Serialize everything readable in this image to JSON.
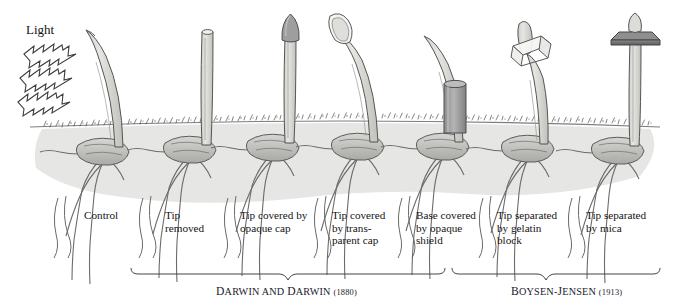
{
  "figure": {
    "title_word": "Light",
    "soil_color": "#e3e3e3",
    "coleoptile_color": "#d8d8d4",
    "opaque_color": "#9a9a9a",
    "mica_color": "#6e6e6e",
    "outline_color": "#4a4a4a",
    "background": "#ffffff"
  },
  "light": {
    "label": "Light",
    "arrow_count": 3,
    "direction": "left-to-right-downward",
    "icon": "lightning-arrow-icon"
  },
  "specimens": [
    {
      "index": 1,
      "label": "Control",
      "treatment": "none",
      "tip_state": "intact",
      "response": "bends toward light",
      "stem_x": 120
    },
    {
      "index": 2,
      "label": "Tip\nremoved",
      "treatment": "tip cut off",
      "tip_state": "removed",
      "response": "no bending",
      "stem_x": 207
    },
    {
      "index": 3,
      "label": "Tip covered by\nopaque cap",
      "treatment": "opaque cap over tip",
      "tip_state": "covered-opaque",
      "response": "no bending",
      "stem_x": 290
    },
    {
      "index": 4,
      "label": "Tip covered\nby trans-\nparent cap",
      "treatment": "transparent cap over tip",
      "tip_state": "covered-transparent",
      "response": "bends toward light",
      "stem_x": 375
    },
    {
      "index": 5,
      "label": "Base covered\nby opaque\nshield",
      "treatment": "opaque shield around base",
      "tip_state": "intact",
      "response": "bends toward light",
      "stem_x": 460
    },
    {
      "index": 6,
      "label": "Tip separated\nby gelatin\nblock",
      "treatment": "gelatin block between tip and stem",
      "tip_state": "separated-gelatin",
      "response": "bends toward light",
      "stem_x": 545
    },
    {
      "index": 7,
      "label": "Tip separated\nby mica",
      "treatment": "mica plate between tip and stem",
      "tip_state": "separated-mica",
      "response": "no bending",
      "stem_x": 635
    }
  ],
  "brackets": [
    {
      "id": "darwin",
      "name": "DARWIN AND DARWIN",
      "name_caps": "D",
      "year": "(1880)",
      "covers": [
        1,
        2,
        3,
        4,
        5
      ]
    },
    {
      "id": "boysen-jensen",
      "name": "BOYSEN-JENSEN",
      "year": "(1913)",
      "covers": [
        6,
        7
      ]
    }
  ],
  "bracket_labels": {
    "darwin_a": "D",
    "darwin_b": "ARWIN AND ",
    "darwin_c": "D",
    "darwin_d": "ARWIN ",
    "darwin_year": "(1880)",
    "bj_a": "B",
    "bj_b": "OYSEN-",
    "bj_c": "J",
    "bj_d": "ENSEN ",
    "bj_year": "(1913)"
  }
}
